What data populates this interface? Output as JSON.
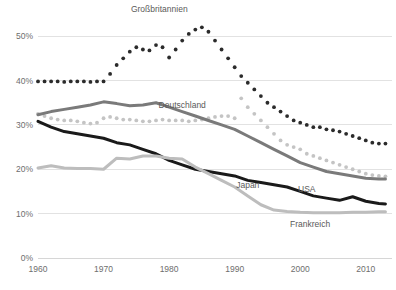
{
  "chart_data": {
    "type": "line",
    "title": "",
    "subtitle": "",
    "xlabel": "",
    "ylabel": "",
    "xlim": [
      1960,
      2014
    ],
    "ylim": [
      0,
      55
    ],
    "grid": true,
    "legend_position": "inline-labels",
    "y_ticks": [
      "0%",
      "10%",
      "20%",
      "30%",
      "40%",
      "50%"
    ],
    "y_tick_values": [
      0,
      10,
      20,
      30,
      40,
      50
    ],
    "x_ticks": [
      "1960",
      "1970",
      "1980",
      "1990",
      "2000",
      "2010"
    ],
    "x_tick_values": [
      1960,
      1970,
      1980,
      1990,
      2000,
      2010
    ],
    "series": [
      {
        "name": "Großbritannien",
        "color": "#2b2b2b",
        "style": "dotted",
        "label_x": 1978.5,
        "label_y": 55.5,
        "x": [
          1960,
          1961,
          1962,
          1963,
          1964,
          1965,
          1966,
          1967,
          1968,
          1969,
          1970,
          1971,
          1972,
          1973,
          1974,
          1975,
          1976,
          1977,
          1978,
          1979,
          1980,
          1981,
          1982,
          1983,
          1984,
          1985,
          1986,
          1987,
          1988,
          1989,
          1990,
          1991,
          1992,
          1993,
          1994,
          1995,
          1996,
          1997,
          1998,
          1999,
          2000,
          2001,
          2002,
          2003,
          2004,
          2005,
          2006,
          2007,
          2008,
          2009,
          2010,
          2011,
          2012,
          2013
        ],
        "values": [
          39.8,
          39.8,
          39.8,
          39.8,
          39.7,
          39.8,
          39.8,
          39.8,
          39.7,
          39.8,
          39.8,
          41.5,
          43.5,
          45.0,
          46.5,
          47.5,
          47.0,
          46.8,
          48.0,
          47.5,
          45.2,
          47.0,
          49.0,
          50.5,
          51.5,
          52.0,
          51.0,
          49.0,
          47.0,
          45.0,
          43.0,
          41.0,
          39.5,
          38.0,
          36.5,
          35.0,
          34.0,
          33.0,
          32.0,
          31.0,
          30.5,
          30.0,
          29.5,
          29.5,
          29.0,
          28.8,
          28.5,
          28.0,
          27.5,
          27.0,
          26.5,
          26.0,
          25.8,
          25.8
        ]
      },
      {
        "name": "Deutschland",
        "color": "#c4c4c4",
        "style": "dotted",
        "label_x": 1982.0,
        "label_y": 33.8,
        "x": [
          1960,
          1961,
          1962,
          1963,
          1964,
          1965,
          1966,
          1967,
          1968,
          1969,
          1970,
          1971,
          1972,
          1973,
          1974,
          1975,
          1976,
          1977,
          1978,
          1979,
          1980,
          1981,
          1982,
          1983,
          1984,
          1985,
          1986,
          1987,
          1988,
          1989,
          1990,
          1991,
          1992,
          1993,
          1994,
          1995,
          1996,
          1997,
          1998,
          1999,
          2000,
          2001,
          2002,
          2003,
          2004,
          2005,
          2006,
          2007,
          2008,
          2009,
          2010,
          2011,
          2012,
          2013
        ],
        "values": [
          32.5,
          32.0,
          31.5,
          31.2,
          31.0,
          31.0,
          30.8,
          30.5,
          30.3,
          30.5,
          31.5,
          31.8,
          31.5,
          31.2,
          31.2,
          31.0,
          30.8,
          30.8,
          31.0,
          31.2,
          31.0,
          31.0,
          31.0,
          30.8,
          31.0,
          31.2,
          31.5,
          31.8,
          32.0,
          32.0,
          31.5,
          36.0,
          34.0,
          32.5,
          31.0,
          29.5,
          28.0,
          26.5,
          25.5,
          25.0,
          24.5,
          23.5,
          23.0,
          22.5,
          22.0,
          21.5,
          21.0,
          20.5,
          20.0,
          19.5,
          19.0,
          18.7,
          18.5,
          18.4
        ]
      },
      {
        "name": "Japan",
        "color": "#7a7a7a",
        "style": "solid",
        "label_x": 1992.0,
        "label_y": 15.8,
        "x": [
          1960,
          1962,
          1964,
          1966,
          1968,
          1970,
          1972,
          1974,
          1976,
          1978,
          1980,
          1982,
          1984,
          1986,
          1988,
          1990,
          1992,
          1994,
          1996,
          1998,
          2000,
          2002,
          2004,
          2006,
          2008,
          2010,
          2012,
          2013
        ],
        "values": [
          32.3,
          33.0,
          33.5,
          34.0,
          34.5,
          35.2,
          34.8,
          34.3,
          34.5,
          35.0,
          34.0,
          33.0,
          32.0,
          31.0,
          30.0,
          29.0,
          27.5,
          26.0,
          24.5,
          23.0,
          21.5,
          20.5,
          19.5,
          19.0,
          18.5,
          18.0,
          17.8,
          17.8
        ]
      },
      {
        "name": "USA",
        "color": "#1a1a1a",
        "style": "solid",
        "label_x": 2001.0,
        "label_y": 14.8,
        "x": [
          1960,
          1962,
          1964,
          1966,
          1968,
          1970,
          1972,
          1974,
          1976,
          1978,
          1980,
          1982,
          1984,
          1986,
          1988,
          1990,
          1992,
          1994,
          1996,
          1998,
          2000,
          2002,
          2004,
          2006,
          2008,
          2010,
          2012,
          2013
        ],
        "values": [
          30.8,
          29.5,
          28.5,
          28.0,
          27.5,
          27.0,
          26.0,
          25.5,
          24.5,
          23.5,
          22.0,
          21.0,
          20.0,
          19.5,
          19.0,
          18.5,
          17.5,
          17.0,
          16.5,
          16.0,
          15.0,
          14.0,
          13.5,
          13.0,
          13.8,
          12.8,
          12.3,
          12.2
        ]
      },
      {
        "name": "Frankreich",
        "color": "#bdbdbd",
        "style": "solid",
        "label_x": 2001.5,
        "label_y": 7.0,
        "x": [
          1960,
          1962,
          1964,
          1966,
          1968,
          1970,
          1972,
          1974,
          1976,
          1978,
          1980,
          1982,
          1984,
          1986,
          1988,
          1990,
          1992,
          1994,
          1996,
          1998,
          2000,
          2002,
          2004,
          2006,
          2008,
          2010,
          2012,
          2013
        ],
        "values": [
          20.3,
          20.8,
          20.3,
          20.2,
          20.2,
          20.0,
          22.5,
          22.3,
          23.0,
          23.0,
          22.5,
          22.3,
          20.5,
          19.0,
          17.5,
          16.0,
          14.0,
          12.0,
          10.8,
          10.5,
          10.3,
          10.2,
          10.2,
          10.2,
          10.3,
          10.3,
          10.4,
          10.4
        ]
      }
    ]
  }
}
